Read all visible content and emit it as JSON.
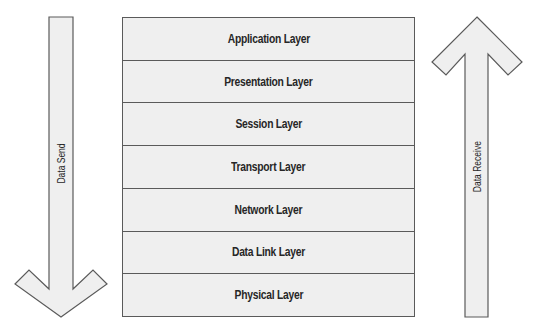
{
  "diagram": {
    "layers": [
      {
        "label": "Application Layer"
      },
      {
        "label": "Presentation Layer"
      },
      {
        "label": "Session Layer"
      },
      {
        "label": "Transport Layer"
      },
      {
        "label": "Network Layer"
      },
      {
        "label": "Data Link Layer"
      },
      {
        "label": "Physical Layer"
      }
    ],
    "left_arrow": {
      "label": "Data Send",
      "direction": "down",
      "icon": "arrow-down-icon"
    },
    "right_arrow": {
      "label": "Data Receive",
      "direction": "up",
      "icon": "arrow-up-icon"
    },
    "colors": {
      "fill": "#efefef",
      "stroke": "#5a5a5a",
      "text": "#262626"
    }
  }
}
